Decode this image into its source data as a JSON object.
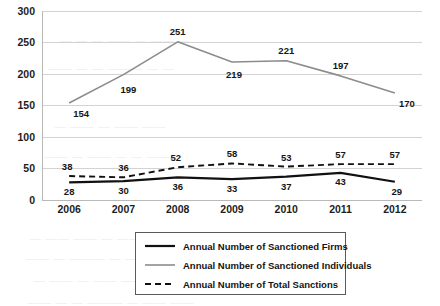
{
  "chart_data": {
    "type": "line",
    "title": "",
    "xlabel": "",
    "ylabel": "",
    "categories": [
      "2006",
      "2007",
      "2008",
      "2009",
      "2010",
      "2011",
      "2012"
    ],
    "ylim": [
      0,
      300
    ],
    "yticks": [
      0,
      50,
      100,
      150,
      200,
      250,
      300
    ],
    "ytick_labels": [
      "0",
      "50",
      "100",
      "150",
      "200",
      "250",
      "300"
    ],
    "grid": true,
    "legend_position": "bottom-center",
    "series": [
      {
        "name": "Annual Number of Sanctioned Firms",
        "style": "solid",
        "color": "#111111",
        "width": 2.2,
        "values": [
          28,
          30,
          36,
          33,
          37,
          43,
          29
        ],
        "label_text": [
          "28",
          "30",
          "36",
          "33",
          "37",
          "43",
          "29"
        ],
        "label_dy": [
          13,
          13,
          13,
          13,
          13,
          12,
          13
        ],
        "label_dx": [
          0,
          0,
          0,
          0,
          0,
          0,
          2
        ]
      },
      {
        "name": "Annual Number of Sanctioned Individuals",
        "style": "solid",
        "color": "#8c8c8c",
        "width": 1.6,
        "values": [
          154,
          199,
          251,
          219,
          221,
          197,
          170
        ],
        "label_text": [
          "154",
          "199",
          "251",
          "219",
          "221",
          "197",
          "170"
        ],
        "label_dy": [
          14,
          18,
          -7,
          16,
          -7,
          -7,
          14
        ],
        "label_dx": [
          12,
          5,
          0,
          2,
          0,
          0,
          12
        ]
      },
      {
        "name": "Annual Number of Total Sanctions",
        "style": "dashed",
        "color": "#111111",
        "width": 1.9,
        "values": [
          38,
          36,
          52,
          58,
          53,
          57,
          57
        ],
        "label_text": [
          "38",
          "36",
          "52",
          "58",
          "53",
          "57",
          "57"
        ],
        "label_dy": [
          -6,
          -6,
          -6,
          -6,
          -6,
          -6,
          -6
        ],
        "label_dx": [
          -2,
          0,
          -2,
          0,
          0,
          0,
          0
        ]
      }
    ]
  },
  "legend": {
    "items": [
      {
        "label": "Annual Number of Sanctioned Firms",
        "swatch": "solid-black-thick"
      },
      {
        "label": "Annual Number of Sanctioned Individuals",
        "swatch": "solid-gray-thin"
      },
      {
        "label": "Annual Number of Total Sanctions",
        "swatch": "dashed-black"
      }
    ]
  },
  "colors": {
    "firms": "#111111",
    "individuals": "#8c8c8c",
    "total": "#111111",
    "grid": "#d3d3d3",
    "background": "#ffffff"
  },
  "background_bleed": [
    {
      "text": "— — —  ——  — —— —",
      "x": 60,
      "y": 34
    },
    {
      "text": "—— — —  ———  — —",
      "x": 48,
      "y": 62
    },
    {
      "text": "— ——  — —— ——",
      "x": 55,
      "y": 120
    },
    {
      "text": "—— — ——  — — ——",
      "x": 44,
      "y": 150
    },
    {
      "text": "— —— ——  — ——— — ——",
      "x": 30,
      "y": 232
    },
    {
      "text": "—— — ———  — — —— —",
      "x": 26,
      "y": 252
    },
    {
      "text": "— —— — ——  —— — —",
      "x": 34,
      "y": 274
    },
    {
      "text": "—— — — ——— — —— ——",
      "x": 28,
      "y": 296
    }
  ]
}
